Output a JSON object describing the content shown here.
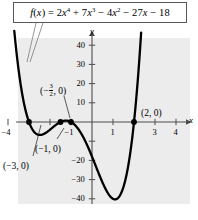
{
  "figure": {
    "equation_label": "f(x) = 2x^4 + 7x^3 - 4x^2 - 27x - 18",
    "background_color": "#ececed",
    "curve_color": "#000000",
    "axis_color": "#4d4d4d"
  },
  "equation": {
    "lhs": "f",
    "lhs_paren_open": "(",
    "lhs_var": "x",
    "lhs_paren_close": ")",
    "equals": "=",
    "t1_coef": "2",
    "t1_var": "x",
    "t1_exp": "4",
    "op1": "+",
    "t2_coef": "7",
    "t2_var": "x",
    "t2_exp": "3",
    "op2": "−",
    "t3_coef": "4",
    "t3_var": "x",
    "t3_exp": "2",
    "op3": "−",
    "t4_coef": "27",
    "t4_var": "x",
    "op4": "−",
    "t5_const": "18"
  },
  "axes": {
    "x_axis_name": "x",
    "y_axis_name": "y",
    "x_tick_labels": [
      "−4",
      "−1",
      "1",
      "3",
      "4"
    ],
    "x_tick_values": [
      -4,
      -1,
      1,
      3,
      4
    ],
    "x_tick_all": [
      -4,
      -3,
      -2,
      -1,
      1,
      2,
      3,
      4
    ],
    "y_tick_labels": [
      "40",
      "30",
      "20",
      "10",
      "−20",
      "−30",
      "−40"
    ],
    "y_tick_values": [
      40,
      30,
      20,
      10,
      -20,
      -30,
      -40
    ],
    "y_tick_all": [
      40,
      30,
      20,
      10,
      -10,
      -20,
      -30,
      -40
    ],
    "xlim": [
      -4.6,
      4.7
    ],
    "ylim": [
      -46,
      47
    ]
  },
  "annotations": [
    {
      "name": "root-neg-three",
      "text": "(−3, 0)",
      "x": 3,
      "y": 161
    },
    {
      "name": "root-neg-one",
      "text": "(−1, 0)",
      "x": 35,
      "y": 144
    },
    {
      "name": "root-two",
      "text": "(2, 0)",
      "x": 141,
      "y": 108
    }
  ],
  "fraction_annotation": {
    "name": "root-neg-three-halves",
    "open": "(",
    "minus": "−",
    "numerator": "3",
    "denominator": "2",
    "comma_zero": ", 0)",
    "x": 40,
    "y": 83
  },
  "points": [
    {
      "label": "(−3, 0)",
      "x": -3,
      "y": 0
    },
    {
      "label": "(−3/2, 0)",
      "x": -1.5,
      "y": 0
    },
    {
      "label": "(−1, 0)",
      "x": -1,
      "y": 0
    },
    {
      "label": "(2, 0)",
      "x": 2,
      "y": 0
    }
  ],
  "chart_data": {
    "type": "line",
    "title": "",
    "xlabel": "x",
    "ylabel": "y",
    "xlim": [
      -4.6,
      4.7
    ],
    "ylim": [
      -46,
      47
    ],
    "grid": false,
    "legend": "none",
    "function": "f(x) = 2x^4 + 7x^3 - 4x^2 - 27x - 18",
    "coefficients": [
      2,
      7,
      -4,
      -27,
      -18
    ],
    "degree": 4,
    "roots": [
      -3,
      -1.5,
      -1,
      2
    ],
    "marked_points": [
      {
        "x": -3,
        "y": 0,
        "label": "(−3, 0)"
      },
      {
        "x": -1.5,
        "y": 0,
        "label": "(−3/2, 0)"
      },
      {
        "x": -1,
        "y": 0,
        "label": "(−1, 0)"
      },
      {
        "x": 2,
        "y": 0,
        "label": "(2, 0)"
      }
    ],
    "local_extrema": [
      {
        "type": "local-minimum",
        "x": -2.2,
        "y": -6
      },
      {
        "type": "local-maximum",
        "x": -1.25,
        "y": 0.4
      },
      {
        "type": "global-minimum",
        "x": 1.3,
        "y": -40
      }
    ],
    "x_ticks": [
      -4,
      -1,
      1,
      3,
      4
    ],
    "y_ticks": [
      40,
      30,
      20,
      10,
      -20,
      -30,
      -40
    ],
    "series": [
      {
        "name": "f(x) = 2x^4 + 7x^3 - 4x^2 - 27x - 18",
        "x": [
          -3.65,
          -3.5,
          -3.25,
          -3.0,
          -2.75,
          -2.5,
          -2.2,
          -2.0,
          -1.75,
          -1.5,
          -1.25,
          -1.0,
          -0.75,
          -0.5,
          -0.25,
          0.0,
          0.25,
          0.5,
          0.75,
          1.0,
          1.25,
          1.5,
          1.75,
          2.0,
          2.25,
          2.5,
          2.6
        ],
        "y": [
          45.0,
          26.0,
          9.4,
          0.0,
          -4.7,
          -5.6,
          -6.0,
          -4.0,
          -0.8,
          0.0,
          0.4,
          0.0,
          -3.2,
          -7.5,
          -12.0,
          -18.0,
          -24.3,
          -30.5,
          -36.0,
          -40.0,
          -40.7,
          -38.8,
          -26.0,
          0.0,
          42.0,
          86.0,
          110.0
        ]
      }
    ]
  }
}
